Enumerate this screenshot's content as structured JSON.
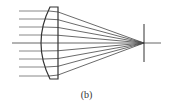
{
  "figure": {
    "caption": "(b)",
    "colors": {
      "incoming_ray": "#888888",
      "refracted_ray": "#444444",
      "lens_outline": "#333333",
      "axis": "#555555",
      "focal_plane": "#333333"
    },
    "lens": {
      "top_y": 7,
      "bottom_y": 79,
      "flat_x": 58,
      "corner_x": 50,
      "vertex_x": 40
    },
    "optical_axis": {
      "x1": 12,
      "x2": 161,
      "y": 43
    },
    "focal_point": {
      "x": 144,
      "y": 43
    },
    "focal_plane": {
      "x": 144,
      "y1": 24,
      "y2": 62
    },
    "rays": [
      {
        "y": 11,
        "enter_x": 49
      },
      {
        "y": 19,
        "enter_x": 46
      },
      {
        "y": 27,
        "enter_x": 43
      },
      {
        "y": 35,
        "enter_x": 41
      },
      {
        "y": 51,
        "enter_x": 41
      },
      {
        "y": 59,
        "enter_x": 43
      },
      {
        "y": 67,
        "enter_x": 46
      },
      {
        "y": 76,
        "enter_x": 49
      }
    ],
    "ray_start_x": 19
  }
}
